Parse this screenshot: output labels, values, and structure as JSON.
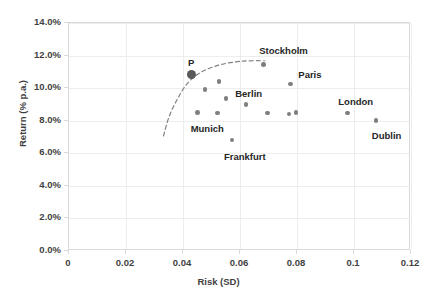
{
  "chart_data": {
    "type": "scatter",
    "title": "",
    "xlabel": "Risk (SD)",
    "ylabel": "Return (% p.a.)",
    "xlim": [
      0,
      0.12
    ],
    "ylim": [
      0,
      0.14
    ],
    "xticks": [
      "0",
      "0.02",
      "0.04",
      "0.06",
      "0.08",
      "0.1",
      "0.12"
    ],
    "xtick_values": [
      0,
      0.02,
      0.04,
      0.06,
      0.08,
      0.1,
      0.12
    ],
    "yticks": [
      "0.0%",
      "2.0%",
      "4.0%",
      "6.0%",
      "8.0%",
      "10.0%",
      "12.0%",
      "14.0%"
    ],
    "ytick_values": [
      0,
      0.02,
      0.04,
      0.06,
      0.08,
      0.1,
      0.12,
      0.14
    ],
    "grid": true,
    "legend": "none",
    "marker_color": "#7f7f7f",
    "highlight_color": "#595959",
    "frontier_style": "dashed",
    "points": [
      {
        "name": "P",
        "x": 0.0435,
        "y": 0.1075,
        "label": "P",
        "label_dx": -4,
        "label_dy": -17,
        "highlight": true
      },
      {
        "name": "Stockholm",
        "x": 0.0685,
        "y": 0.114,
        "label": "Stockholm",
        "label_dx": -4,
        "label_dy": -18,
        "highlight": false
      },
      {
        "name": "Berlin",
        "x": 0.0555,
        "y": 0.093,
        "label": "Berlin",
        "label_dx": 9,
        "label_dy": -10,
        "highlight": false
      },
      {
        "name": "Paris",
        "x": 0.078,
        "y": 0.102,
        "label": "Paris",
        "label_dx": 8,
        "label_dy": -14,
        "highlight": false
      },
      {
        "name": "London",
        "x": 0.098,
        "y": 0.084,
        "label": "London",
        "label_dx": -9,
        "label_dy": -16,
        "highlight": false
      },
      {
        "name": "Dublin",
        "x": 0.108,
        "y": 0.0795,
        "label": "Dublin",
        "label_dx": -4,
        "label_dy": 10,
        "highlight": false
      },
      {
        "name": "Munich",
        "x": 0.0525,
        "y": 0.084,
        "label": "Munich",
        "label_dx": -27,
        "label_dy": 11,
        "highlight": false
      },
      {
        "name": "Frankfurt",
        "x": 0.0575,
        "y": 0.0675,
        "label": "Frankfurt",
        "label_dx": -8,
        "label_dy": 12,
        "highlight": false
      },
      {
        "name": "unlabeled-1",
        "x": 0.048,
        "y": 0.0985,
        "label": "",
        "highlight": false
      },
      {
        "name": "unlabeled-2",
        "x": 0.053,
        "y": 0.1035,
        "label": "",
        "highlight": false
      },
      {
        "name": "unlabeled-3",
        "x": 0.0625,
        "y": 0.0895,
        "label": "",
        "highlight": false
      },
      {
        "name": "unlabeled-4",
        "x": 0.0455,
        "y": 0.0845,
        "label": "",
        "highlight": false
      },
      {
        "name": "unlabeled-5",
        "x": 0.07,
        "y": 0.084,
        "label": "",
        "highlight": false
      },
      {
        "name": "unlabeled-6",
        "x": 0.0775,
        "y": 0.0835,
        "label": "",
        "highlight": false
      },
      {
        "name": "unlabeled-7",
        "x": 0.08,
        "y": 0.0845,
        "label": "",
        "highlight": false
      }
    ],
    "frontier": [
      {
        "x": 0.0335,
        "y": 0.07
      },
      {
        "x": 0.0355,
        "y": 0.082
      },
      {
        "x": 0.0385,
        "y": 0.093
      },
      {
        "x": 0.042,
        "y": 0.1025
      },
      {
        "x": 0.047,
        "y": 0.1095
      },
      {
        "x": 0.054,
        "y": 0.114
      },
      {
        "x": 0.0615,
        "y": 0.116
      },
      {
        "x": 0.069,
        "y": 0.1162
      }
    ]
  }
}
